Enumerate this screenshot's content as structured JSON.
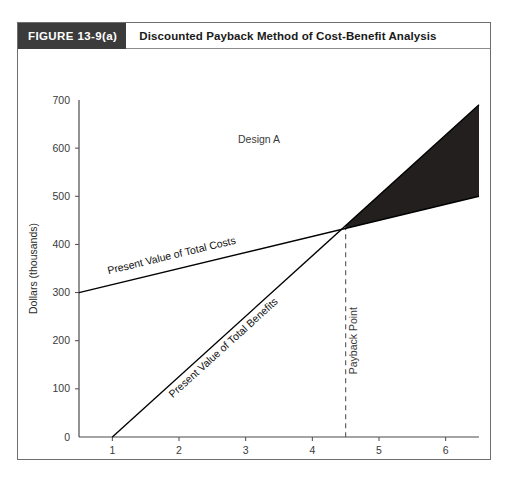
{
  "figure": {
    "number_label": "FIGURE 13-9(a)",
    "caption": "Discounted Payback Method of Cost-Benefit Analysis"
  },
  "chart_data": {
    "type": "line",
    "title": "Discounted Payback Method of Cost-Benefit Analysis",
    "xlabel": "Period",
    "ylabel": "Dollars (thousands)",
    "xlim": [
      0.5,
      6.5
    ],
    "ylim": [
      0,
      700
    ],
    "x_ticks": [
      "1",
      "2",
      "3",
      "4",
      "5",
      "6"
    ],
    "x_tick_values": [
      1,
      2,
      3,
      4,
      5,
      6
    ],
    "y_ticks": [
      "0",
      "100",
      "200",
      "300",
      "400",
      "500",
      "600",
      "700"
    ],
    "y_tick_values": [
      0,
      100,
      200,
      300,
      400,
      500,
      600,
      700
    ],
    "grid": false,
    "legend": "none",
    "series": [
      {
        "name": "Present Value of Total Costs",
        "x": [
          0.5,
          6.5
        ],
        "values": [
          300,
          500
        ]
      },
      {
        "name": "Present Value of Total Benefits",
        "x": [
          1.0,
          6.5
        ],
        "values": [
          0,
          690
        ]
      }
    ],
    "annotations": [
      {
        "name": "design-label",
        "text": "Design A",
        "x": 3.2,
        "y": 610
      },
      {
        "name": "payback-label",
        "text": "Payback Point",
        "x": 4.5,
        "y": 200
      },
      {
        "name": "cost-series-label",
        "text": "Present Value of Total Costs",
        "x": 1.9,
        "y": 370
      },
      {
        "name": "benefit-series-label",
        "text": "Present Value of Total Benefits",
        "x": 2.7,
        "y": 180
      }
    ],
    "payback_point": {
      "x": 4.5,
      "y": 440
    },
    "shaded_region": {
      "name": "net-benefit-wedge",
      "description": "Region between benefits and costs lines after the payback point",
      "from_x": 4.5,
      "to_x": 6.5,
      "color": "#231f1f"
    }
  },
  "colors": {
    "header_tab_bg": "#3b3b3b",
    "header_tab_text": "#ffffff",
    "frame_border": "#6e6e6e",
    "axis": "#4a4a4a",
    "line": "#000000",
    "wedge_fill": "#231f1f",
    "payback_dash": "#555555",
    "page_bg": "#ffffff"
  }
}
